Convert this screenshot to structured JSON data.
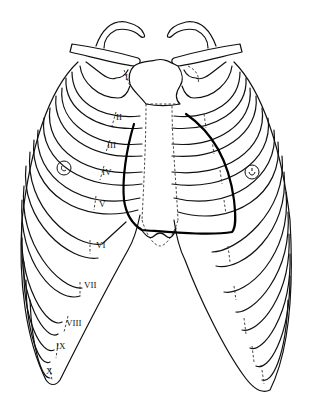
{
  "diagram": {
    "rib_labels": [
      "I",
      "II",
      "III",
      "IV",
      "V",
      "VI",
      "VII",
      "VIII",
      "IX",
      "X"
    ],
    "markers": [
      {
        "name": "right-nipple",
        "side": "right"
      },
      {
        "name": "left-nipple",
        "side": "left"
      }
    ],
    "colors": {
      "line": "#111111",
      "heart_outline": "#000000",
      "background": "#ffffff"
    }
  }
}
